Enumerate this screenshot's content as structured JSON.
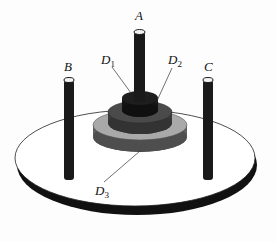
{
  "figure": {
    "pegs": [
      {
        "id": "A",
        "label": "A"
      },
      {
        "id": "B",
        "label": "B"
      },
      {
        "id": "C",
        "label": "C"
      }
    ],
    "discs": [
      {
        "id": "D1",
        "label": "D",
        "subscript": "1",
        "size": "small"
      },
      {
        "id": "D2",
        "label": "D",
        "subscript": "2",
        "size": "medium"
      },
      {
        "id": "D3",
        "label": "D",
        "subscript": "3",
        "size": "large"
      }
    ],
    "colors": {
      "base_top": "#ffffff",
      "base_edge": "#111111",
      "peg": "#1a1a1a",
      "peg_top": "#f4f4f4",
      "disc1_top": "#1e1e1e",
      "disc1_side": "#141414",
      "disc2_top": "#4a4a4a",
      "disc2_side": "#3a3a3a",
      "disc3_top": "#a9a9a9",
      "disc3_side": "#5f5f5f",
      "leader_line": "#333333"
    }
  }
}
